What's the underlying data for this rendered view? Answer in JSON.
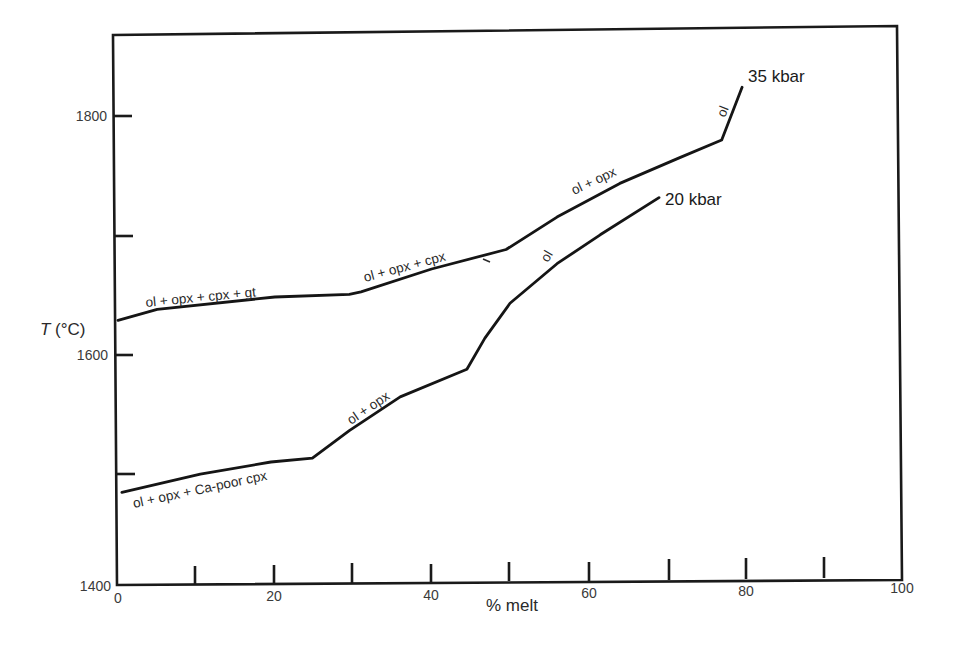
{
  "chart_data": {
    "type": "line",
    "title": "",
    "xlabel": "% melt",
    "ylabel": "T (°C)",
    "xlim": [
      0,
      100
    ],
    "ylim": [
      1400,
      1850
    ],
    "grid": false,
    "legend": "inline curve labels",
    "x_ticks": [
      0,
      10,
      20,
      30,
      40,
      50,
      60,
      70,
      80,
      90,
      100
    ],
    "x_tick_labels": [
      "0",
      "20",
      "40",
      "60",
      "80",
      "100"
    ],
    "y_ticks": [
      1400,
      1500,
      1600,
      1700,
      1800
    ],
    "y_tick_labels": [
      "1400",
      "1600",
      "1800"
    ],
    "series": [
      {
        "name": "35 kbar",
        "x": [
          0,
          5,
          20,
          29.5,
          31,
          40,
          49.5,
          56,
          64,
          71.5,
          77,
          79.6
        ],
        "y": [
          1629,
          1638,
          1648,
          1650,
          1652,
          1671,
          1687,
          1714,
          1742,
          1763,
          1778,
          1822
        ],
        "phase_fields": [
          {
            "label": "ol + opx + cpx + gt",
            "x_range": [
              0,
              30
            ]
          },
          {
            "label": "ol + opx + cpx",
            "x_range": [
              30,
              50
            ]
          },
          {
            "label": "ol + opx",
            "x_range": [
              50,
              77
            ]
          },
          {
            "label": "ol",
            "x_range": [
              77,
              80
            ]
          }
        ]
      },
      {
        "name": "20 kbar",
        "x": [
          0.5,
          10.5,
          19.5,
          24.8,
          29.5,
          36,
          44.5,
          46.8,
          50,
          56,
          61.5,
          69
        ],
        "y": [
          1485,
          1500,
          1510,
          1513,
          1536,
          1564,
          1587,
          1613,
          1642,
          1675,
          1699,
          1730
        ],
        "phase_fields": [
          {
            "label": "ol + opx + Ca-poor cpx",
            "x_range": [
              0,
              25
            ]
          },
          {
            "label": "ol + opx",
            "x_range": [
              25,
              45
            ]
          },
          {
            "label": "ol",
            "x_range": [
              45,
              69
            ]
          }
        ]
      }
    ]
  },
  "axes": {
    "xlabel": "% melt",
    "ylabel_italic": "T",
    "ylabel_unit": " (°C)",
    "x_tick_labels": [
      "0",
      "20",
      "40",
      "60",
      "80",
      "100"
    ],
    "y_tick_labels": [
      "1400",
      "1600",
      "1800"
    ]
  },
  "labels": {
    "s35": "35 kbar",
    "s20": "20 kbar",
    "s35_f1": "ol + opx + cpx + gt",
    "s35_f2": "ol + opx + cpx",
    "s35_f3": "ol + opx",
    "s35_f4": "ol",
    "s20_f1": "ol + opx + Ca-poor cpx",
    "s20_f2": "ol + opx",
    "s20_f3": "ol"
  }
}
